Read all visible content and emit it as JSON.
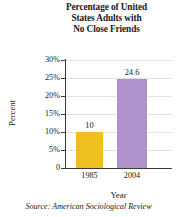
{
  "chart_data": {
    "type": "bar",
    "title": "Percentage of United States Adults with No Close Friends",
    "title_lines": [
      "Percentage of United",
      "States Adults with",
      "No Close Friends"
    ],
    "categories": [
      "1985",
      "2004"
    ],
    "values": [
      10,
      24.6
    ],
    "value_labels": [
      "10",
      "24.6"
    ],
    "xlabel": "Year",
    "ylabel": "Percent",
    "ylim": [
      0,
      30
    ],
    "yticks": [
      0,
      5,
      10,
      15,
      20,
      25,
      30
    ],
    "ytick_labels": [
      "0",
      "5%",
      "10%",
      "15%",
      "20%",
      "25%",
      "30%"
    ],
    "grid": true,
    "legend": "none",
    "bar_colors": [
      "#EFBE21",
      "#AF91CB"
    ],
    "source": "Source: American Sociological Review"
  },
  "colors": {
    "background": "#ffffff",
    "axis": "#3a3a3a",
    "grid": "#e2e2e6",
    "bar_1985": "#EFBE21",
    "bar_2004": "#AF91CB",
    "text": "#1a1a1a"
  }
}
